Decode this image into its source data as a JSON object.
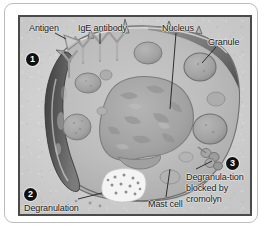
{
  "figure": {
    "labels": {
      "antigen": "Antigen",
      "ige_antibody": "IgE antibody",
      "nucleus": "Nucleus",
      "granule": "Granule",
      "mast_cell": "Mast cell",
      "degranulation": "Degranulation",
      "cromolyn": "Degranula-tion blocked by cromolyn"
    },
    "markers": [
      {
        "number": "1",
        "refers_to": "Antigen"
      },
      {
        "number": "2",
        "refers_to": "Degranulation"
      },
      {
        "number": "3",
        "refers_to": "Degranulation blocked by cromolyn"
      }
    ],
    "colors": {
      "plate_background": "#d2d2d2",
      "cytoplasm": "#b9b9b9",
      "nucleus": "#a5a5a5",
      "granule": "#9e9e9e",
      "membrane_outline": "#5a5a5a",
      "degranulation_dark": "#4f4f4f",
      "released_granules": "#f2f2f2",
      "marker_fill": "#111111",
      "marker_text": "#ffffff",
      "frame_border": "#4a4a4a"
    }
  }
}
